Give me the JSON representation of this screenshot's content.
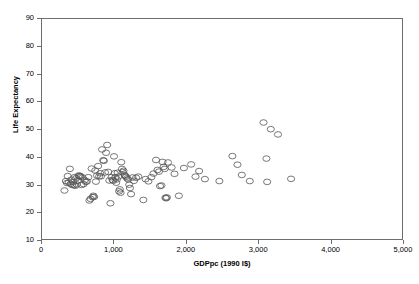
{
  "chart_data": {
    "type": "scatter",
    "title": "",
    "xlabel": "GDPpc (1990 I$)",
    "ylabel": "Life Expectancy",
    "xlim": [
      0,
      5000
    ],
    "ylim": [
      10,
      90
    ],
    "xticks": [
      0,
      1000,
      2000,
      3000,
      4000,
      5000
    ],
    "xtick_labels": [
      "0",
      "1,000",
      "2,000",
      "3,000",
      "4,000",
      "5,000"
    ],
    "yticks": [
      10,
      20,
      30,
      40,
      50,
      60,
      70,
      80,
      90
    ],
    "ytick_labels": [
      "10",
      "20",
      "30",
      "40",
      "50",
      "60",
      "70",
      "80",
      "90"
    ],
    "grid": false,
    "legend": null,
    "marker": {
      "shape": "circle-open",
      "size": 3.6,
      "edge_color": "#555555",
      "fill_color": "none",
      "edge_width": 0.8
    },
    "series": [
      {
        "name": "countries",
        "n_points": 122,
        "points": [
          [
            310,
            28.2
          ],
          [
            330,
            31.6
          ],
          [
            345,
            30.9
          ],
          [
            355,
            33.4
          ],
          [
            370,
            31.1
          ],
          [
            385,
            36.0
          ],
          [
            395,
            30.6
          ],
          [
            405,
            32.1
          ],
          [
            415,
            30.2
          ],
          [
            430,
            31.3
          ],
          [
            440,
            30.1
          ],
          [
            450,
            33.0
          ],
          [
            460,
            29.9
          ],
          [
            470,
            32.6
          ],
          [
            480,
            30.4
          ],
          [
            495,
            31.8
          ],
          [
            505,
            33.6
          ],
          [
            515,
            33.3
          ],
          [
            525,
            33.5
          ],
          [
            535,
            33.1
          ],
          [
            545,
            30.2
          ],
          [
            560,
            32.9
          ],
          [
            575,
            30.5
          ],
          [
            590,
            31.9
          ],
          [
            605,
            31.3
          ],
          [
            620,
            31.5
          ],
          [
            640,
            33.0
          ],
          [
            655,
            24.6
          ],
          [
            670,
            25.2
          ],
          [
            685,
            36.1
          ],
          [
            700,
            25.8
          ],
          [
            710,
            26.3
          ],
          [
            720,
            25.9
          ],
          [
            735,
            35.4
          ],
          [
            745,
            31.4
          ],
          [
            760,
            33.6
          ],
          [
            775,
            37.0
          ],
          [
            790,
            33.3
          ],
          [
            805,
            34.4
          ],
          [
            815,
            33.3
          ],
          [
            830,
            43.0
          ],
          [
            845,
            39.1
          ],
          [
            855,
            38.9
          ],
          [
            870,
            34.7
          ],
          [
            885,
            41.8
          ],
          [
            900,
            44.6
          ],
          [
            915,
            34.9
          ],
          [
            930,
            31.8
          ],
          [
            945,
            23.6
          ],
          [
            960,
            33.0
          ],
          [
            975,
            32.0
          ],
          [
            985,
            31.7
          ],
          [
            995,
            40.5
          ],
          [
            1005,
            34.4
          ],
          [
            1015,
            33.0
          ],
          [
            1025,
            31.0
          ],
          [
            1035,
            32.2
          ],
          [
            1045,
            34.6
          ],
          [
            1055,
            33.2
          ],
          [
            1065,
            27.9
          ],
          [
            1075,
            28.6
          ],
          [
            1085,
            27.4
          ],
          [
            1095,
            38.4
          ],
          [
            1105,
            36.0
          ],
          [
            1115,
            34.8
          ],
          [
            1125,
            35.3
          ],
          [
            1140,
            33.8
          ],
          [
            1150,
            33.5
          ],
          [
            1160,
            33.1
          ],
          [
            1175,
            32.6
          ],
          [
            1190,
            32.2
          ],
          [
            1205,
            30.3
          ],
          [
            1215,
            29.1
          ],
          [
            1230,
            26.9
          ],
          [
            1250,
            32.9
          ],
          [
            1270,
            31.7
          ],
          [
            1300,
            32.8
          ],
          [
            1330,
            33.2
          ],
          [
            1400,
            24.8
          ],
          [
            1430,
            32.3
          ],
          [
            1470,
            31.5
          ],
          [
            1510,
            33.0
          ],
          [
            1540,
            34.3
          ],
          [
            1575,
            39.2
          ],
          [
            1595,
            35.6
          ],
          [
            1615,
            35.0
          ],
          [
            1630,
            29.8
          ],
          [
            1650,
            30.0
          ],
          [
            1665,
            38.5
          ],
          [
            1680,
            36.7
          ],
          [
            1695,
            36.0
          ],
          [
            1705,
            25.6
          ],
          [
            1715,
            25.4
          ],
          [
            1725,
            25.7
          ],
          [
            1740,
            38.3
          ],
          [
            1790,
            36.5
          ],
          [
            1830,
            34.2
          ],
          [
            1890,
            26.3
          ],
          [
            1960,
            36.3
          ],
          [
            2060,
            37.6
          ],
          [
            2120,
            33.2
          ],
          [
            2170,
            35.2
          ],
          [
            2250,
            32.3
          ],
          [
            2450,
            31.6
          ],
          [
            2630,
            40.6
          ],
          [
            2700,
            37.5
          ],
          [
            2760,
            33.8
          ],
          [
            2870,
            31.6
          ],
          [
            3060,
            52.7
          ],
          [
            3100,
            39.7
          ],
          [
            3110,
            31.3
          ],
          [
            3160,
            50.3
          ],
          [
            3260,
            48.4
          ],
          [
            3440,
            32.4
          ]
        ]
      }
    ]
  },
  "axes": {
    "x_title": "GDPpc (1990 I$)",
    "y_title": "Life Expectancy"
  }
}
